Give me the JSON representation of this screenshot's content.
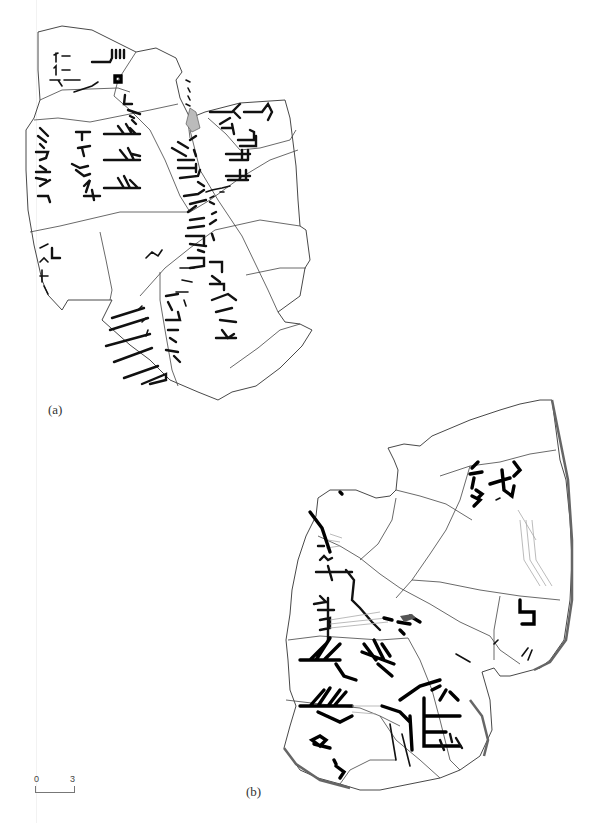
{
  "figure": {
    "panels": [
      {
        "id": "a",
        "label": "(a)",
        "description": "Line drawing of a rejoined inscribed bone fragment group with incised characters"
      },
      {
        "id": "b",
        "label": "(b)",
        "description": "Line drawing of a second rejoined inscribed fragment group with incised characters"
      }
    ],
    "scale_bar": {
      "start_label": "0",
      "end_label": "3"
    },
    "colors": {
      "outline": "#333333",
      "ink": "#111111",
      "background": "#ffffff",
      "faint_trace": "#aaaaaa"
    }
  }
}
